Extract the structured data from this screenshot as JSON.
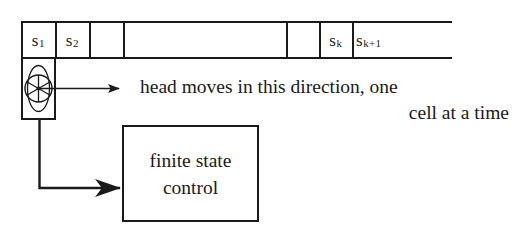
{
  "figure": {
    "ink_color": "#1a1a1a",
    "background_color": "#ffffff"
  },
  "tape": {
    "cells": [
      {
        "id": "cell-s1",
        "symbol": "s",
        "subscript": "1",
        "left": 0,
        "width": 34,
        "labeled": true
      },
      {
        "id": "cell-s2",
        "symbol": "s",
        "subscript": "2",
        "left": 34,
        "width": 34,
        "labeled": true
      },
      {
        "id": "cell-3",
        "symbol": "",
        "subscript": "",
        "left": 68,
        "width": 34,
        "labeled": false
      },
      {
        "id": "cell-gap",
        "symbol": "",
        "subscript": "",
        "left": 102,
        "width": 163,
        "labeled": false
      },
      {
        "id": "cell-5",
        "symbol": "",
        "subscript": "",
        "left": 265,
        "width": 33,
        "labeled": false
      },
      {
        "id": "cell-sk",
        "symbol": "s",
        "subscript": "k",
        "left": 298,
        "width": 33,
        "labeled": true
      },
      {
        "id": "cell-sk1",
        "symbol": "s",
        "subscript": "k+1",
        "left": 331,
        "width": 100,
        "labeled": true
      }
    ],
    "divider_positions": [
      0,
      34,
      68,
      102,
      265,
      298,
      331
    ],
    "open_right_end": true
  },
  "read_head": {
    "name": "read-write head",
    "spoke_count": 6,
    "has_center_dot": true,
    "has_side_arcs": true
  },
  "direction_arrow": {
    "label": "head movement direction arrow"
  },
  "caption": {
    "line1": "head moves in this direction, one",
    "line2": "cell at a time"
  },
  "control_unit": {
    "line1": "finite state",
    "line2": "control"
  },
  "control_connector": {
    "label": "head to control connector arrow"
  }
}
